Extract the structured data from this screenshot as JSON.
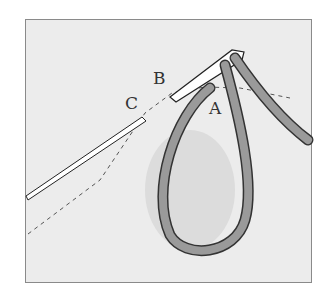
{
  "diagram": {
    "type": "stitching illustration",
    "labels": {
      "a": "A",
      "b": "B",
      "c": "C"
    },
    "colors": {
      "background": "#ececec",
      "thread": "#9a9a9a",
      "outline": "#333333",
      "border": "#8a8a8a"
    }
  }
}
